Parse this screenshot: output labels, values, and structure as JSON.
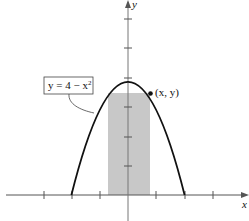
{
  "diagram": {
    "equation_label": {
      "prefix": "y = 4 − x",
      "exponent": "2"
    },
    "point_label": "(x, y)",
    "x_axis_label": "x",
    "y_axis_label": "y",
    "curve": "y = 4 - x^2",
    "shaded_rectangle": {
      "x_from": -0.7,
      "x_to": 0.8,
      "height_at": "y(x)"
    },
    "x_ticks": [
      -3,
      -2,
      -1,
      1,
      2,
      3
    ],
    "y_ticks": [
      1,
      2,
      3,
      4,
      5,
      6
    ],
    "colors": {
      "shade": "#c8c8c8",
      "curve": "#111111",
      "axis": "#555555"
    }
  }
}
